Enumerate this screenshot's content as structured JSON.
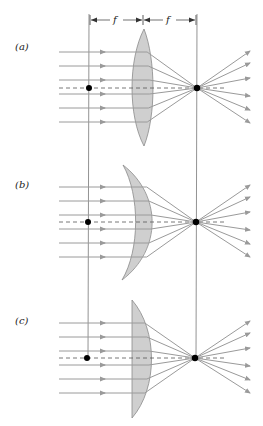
{
  "dimension": {
    "left_label": "f",
    "right_label": "f"
  },
  "colors": {
    "ray": "#9a9a9a",
    "lens_fill": "#cfcfcf",
    "lens_stroke": "#8a8a8a",
    "axis": "#555555",
    "guide": "#777777",
    "focus_dot": "#000000"
  },
  "panels": [
    {
      "id": "a",
      "label": "(a)",
      "lens_type": "biconvex",
      "ray_count": 6
    },
    {
      "id": "b",
      "label": "(b)",
      "lens_type": "meniscus",
      "ray_count": 6
    },
    {
      "id": "c",
      "label": "(c)",
      "lens_type": "plano-convex",
      "ray_count": 6
    }
  ]
}
